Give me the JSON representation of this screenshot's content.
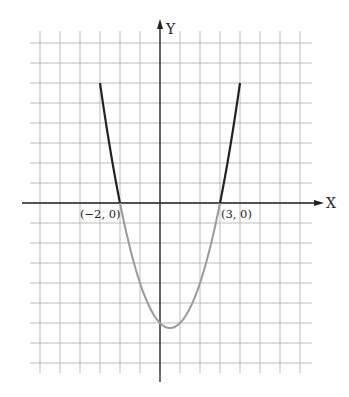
{
  "chart_data": {
    "type": "line",
    "title": "",
    "xlabel": "X",
    "ylabel": "Y",
    "function": "y = (x + 2)(x - 3) = x^2 - x - 6",
    "xlim": [
      -6,
      7
    ],
    "ylim": [
      -8,
      8
    ],
    "grid": true,
    "grid_step": 1,
    "series": [
      {
        "name": "y >= 0 portion",
        "color": "#222222",
        "x_range_left": [
          -3,
          -2
        ],
        "x_range_right": [
          3,
          4
        ]
      },
      {
        "name": "y < 0 portion",
        "color": "#9a9a9a",
        "x_range": [
          -2,
          3
        ]
      }
    ],
    "points": [
      {
        "label": "(−2, 0)",
        "x": -2,
        "y": 0
      },
      {
        "label": "(3, 0)",
        "x": 3,
        "y": 0
      }
    ],
    "vertex": {
      "x": 0.5,
      "y": -6.25
    },
    "endpoints": [
      {
        "x": -3,
        "y": 6
      },
      {
        "x": 4,
        "y": 6
      }
    ]
  },
  "labels": {
    "x_axis": "X",
    "y_axis": "Y",
    "root_left": "(−2, 0)",
    "root_right": "(3, 0)"
  }
}
